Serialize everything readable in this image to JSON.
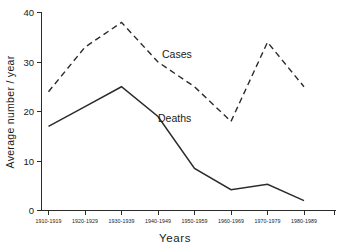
{
  "chart_data": {
    "type": "line",
    "title": "",
    "xlabel": "Years",
    "ylabel": "Average number / year",
    "categories": [
      "1910-1919",
      "1920-1929",
      "1930-1939",
      "1940-1949",
      "1950-1959",
      "1960-1969",
      "1970-1979",
      "1980-1989"
    ],
    "series": [
      {
        "name": "Cases",
        "style": "dashed",
        "values": [
          24,
          33,
          38,
          30,
          25,
          18,
          34,
          25
        ]
      },
      {
        "name": "Deaths",
        "style": "solid",
        "values": [
          17,
          21,
          25,
          19,
          8.5,
          4.2,
          5.3,
          2
        ]
      }
    ],
    "ylim": [
      0,
      40
    ],
    "yticks": [
      0,
      10,
      20,
      30,
      40
    ],
    "ytick_labels": [
      "0",
      "10",
      "20",
      "30",
      "40"
    ],
    "grid": false,
    "legend": "inline-annotations",
    "annotations": [
      {
        "text": "Cases",
        "series": "Cases",
        "x_frac": 0.455,
        "y_value": 29.4
      },
      {
        "text": "Deaths",
        "series": "Deaths",
        "x_frac": 0.455,
        "y_value": 17.2
      }
    ],
    "colors": {
      "line": "#2b2b2b",
      "axis": "#2b2b2b",
      "background": "#ffffff"
    }
  }
}
